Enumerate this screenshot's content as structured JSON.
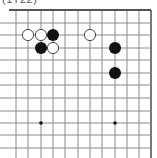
{
  "caption": "(1T22)",
  "board": {
    "colors": {
      "background": "#ffffff",
      "line": "#8a8a8a",
      "border": "#555555",
      "black_stone": "#111111",
      "white_stone": "#ffffff",
      "white_stone_edge": "#333333",
      "star_point": "#111111"
    },
    "grid": {
      "columns_x": [
        16,
        28,
        41,
        53,
        65,
        78,
        90,
        102,
        115,
        127,
        139,
        151
      ],
      "rows_y": [
        10,
        23,
        35,
        48,
        60,
        73,
        85,
        98,
        111,
        123,
        135,
        148
      ],
      "edges": [
        "top",
        "right"
      ]
    },
    "stones": [
      {
        "color": "white",
        "col": 1,
        "row": 2
      },
      {
        "color": "white",
        "col": 2,
        "row": 2
      },
      {
        "color": "black",
        "col": 3,
        "row": 2
      },
      {
        "color": "white",
        "col": 6,
        "row": 2
      },
      {
        "color": "black",
        "col": 2,
        "row": 3
      },
      {
        "color": "white",
        "col": 3,
        "row": 3
      },
      {
        "color": "black",
        "col": 8,
        "row": 3
      },
      {
        "color": "black",
        "col": 8,
        "row": 5
      }
    ],
    "star_points": [
      {
        "col": 2,
        "row": 9
      },
      {
        "col": 8,
        "row": 9
      }
    ]
  }
}
